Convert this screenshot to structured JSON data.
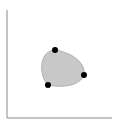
{
  "diagram": {
    "type": "closed-curve-with-control-points",
    "colors": {
      "background": "#ffffff",
      "axis": "#8a8a8a",
      "shape_fill": "#c8c8c8",
      "shape_stroke": "#b0b0b0",
      "point": "#000000"
    },
    "axes": {
      "origin": [
        7,
        118
      ],
      "y_axis_top": [
        7,
        10
      ],
      "x_axis_end": [
        112,
        118
      ]
    },
    "points": [
      {
        "id": "top",
        "x": 55,
        "y": 50
      },
      {
        "id": "right",
        "x": 84,
        "y": 75
      },
      {
        "id": "bottom-left",
        "x": 48,
        "y": 85
      }
    ]
  }
}
